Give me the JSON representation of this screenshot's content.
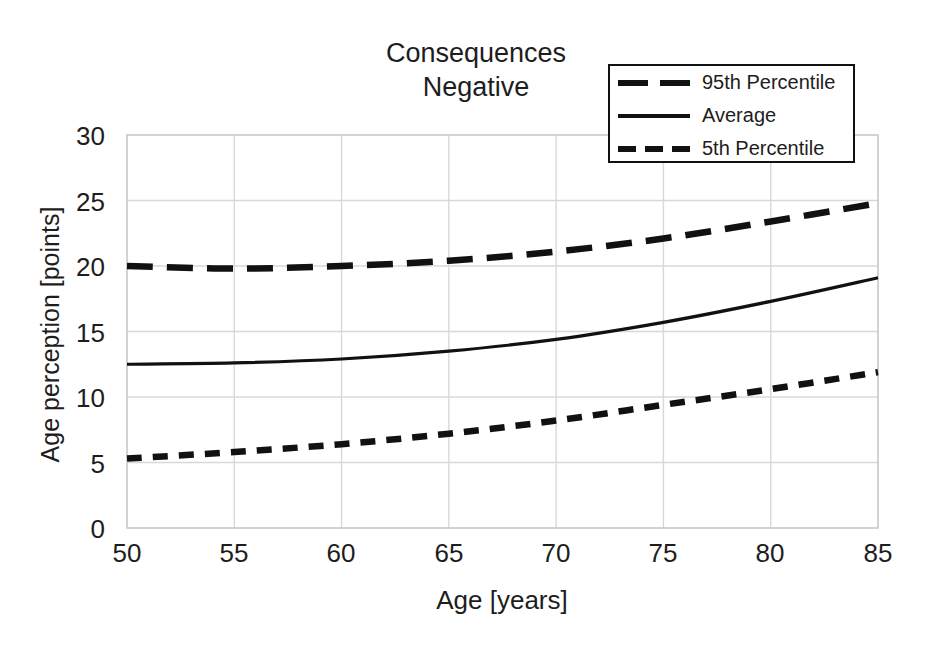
{
  "chart_data": {
    "type": "line",
    "title": "Consequences\nNegative",
    "xlabel": "Age [years]",
    "ylabel": "Age perception [points]",
    "xlim": [
      50,
      85
    ],
    "ylim": [
      0,
      30
    ],
    "xticks": [
      "50",
      "55",
      "60",
      "65",
      "70",
      "75",
      "80",
      "85"
    ],
    "yticks": [
      "0",
      "5",
      "10",
      "15",
      "20",
      "25",
      "30"
    ],
    "grid": true,
    "legend_position": "top-right",
    "x": [
      50,
      55,
      60,
      65,
      70,
      75,
      80,
      85
    ],
    "series": [
      {
        "name": "95th Percentile",
        "style": "long-dash",
        "color": "#111111",
        "values": [
          20.0,
          19.8,
          20.0,
          20.4,
          21.1,
          22.1,
          23.4,
          24.8
        ]
      },
      {
        "name": "Average",
        "style": "solid",
        "color": "#111111",
        "values": [
          12.5,
          12.6,
          12.9,
          13.5,
          14.4,
          15.7,
          17.3,
          19.1
        ]
      },
      {
        "name": "5th Percentile",
        "style": "short-dash",
        "color": "#111111",
        "values": [
          5.3,
          5.8,
          6.4,
          7.2,
          8.2,
          9.4,
          10.6,
          11.9
        ]
      }
    ]
  },
  "legend": {
    "items": [
      {
        "label": "95th Percentile"
      },
      {
        "label": "Average"
      },
      {
        "label": "5th Percentile"
      }
    ]
  }
}
